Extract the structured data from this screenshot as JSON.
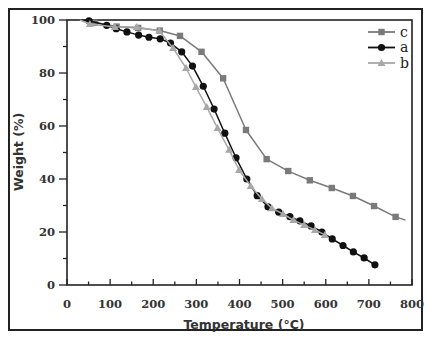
{
  "chart_data": {
    "type": "line",
    "title": "",
    "xlabel": "Temperature (°C)",
    "ylabel": "Weight (%)",
    "xlim": [
      0,
      800
    ],
    "ylim": [
      0,
      100
    ],
    "x_ticks": [
      0,
      100,
      200,
      300,
      400,
      500,
      600,
      700,
      800
    ],
    "y_ticks": [
      0,
      20,
      40,
      60,
      80,
      100
    ],
    "grid": false,
    "legend_position": "upper right",
    "legend": [
      "c",
      "a",
      "b"
    ],
    "series": [
      {
        "name": "c",
        "marker": "square",
        "color": "#7a7a7a",
        "x": [
          30,
          65,
          115,
          165,
          215,
          262,
          312,
          362,
          415,
          463,
          513,
          563,
          614,
          663,
          712,
          762,
          785
        ],
        "y": [
          100,
          99,
          97.5,
          97,
          96,
          94,
          88,
          78,
          58.5,
          47.5,
          43,
          39.5,
          36.6,
          33.6,
          29.8,
          25.7,
          24.5
        ],
        "markers_at": [
          65,
          115,
          165,
          215,
          262,
          312,
          362,
          415,
          463,
          513,
          563,
          614,
          663,
          712,
          762
        ]
      },
      {
        "name": "a",
        "marker": "circle",
        "color": "#111111",
        "x": [
          30,
          51,
          92,
          114,
          139,
          166,
          190,
          216,
          240,
          266,
          291,
          316,
          341,
          366,
          392,
          417,
          441,
          466,
          491,
          517,
          540,
          566,
          591,
          615,
          640,
          664,
          689,
          714
        ],
        "y": [
          100,
          99.7,
          98,
          96.7,
          95.5,
          94.3,
          93.5,
          92.9,
          91.3,
          88,
          82.6,
          75,
          66.4,
          57.3,
          48,
          40,
          33.7,
          29.5,
          27.5,
          25.8,
          24.2,
          22.3,
          20,
          17.4,
          14.9,
          12.5,
          10.2,
          7.6
        ],
        "markers_at": [
          51,
          92,
          114,
          139,
          166,
          190,
          216,
          240,
          266,
          291,
          316,
          341,
          366,
          392,
          417,
          441,
          466,
          491,
          517,
          540,
          566,
          591,
          615,
          640,
          664,
          689,
          714
        ]
      },
      {
        "name": "b",
        "marker": "triangle",
        "color": "#a8a8a8",
        "x": [
          30,
          53,
          111,
          162,
          214,
          246,
          276,
          299,
          324,
          349,
          376,
          399,
          426,
          452,
          475,
          501,
          525,
          550,
          575,
          598
        ],
        "y": [
          100,
          98.5,
          97.4,
          97.4,
          95.9,
          89.4,
          81.9,
          74.7,
          67.2,
          59.2,
          51,
          43.4,
          37.4,
          32.5,
          29,
          26.8,
          24.5,
          22.6,
          20.8,
          18.9
        ],
        "markers_at": [
          53,
          111,
          162,
          214,
          246,
          276,
          299,
          324,
          349,
          376,
          399,
          426,
          452,
          475,
          501,
          525,
          550,
          575,
          598
        ]
      }
    ]
  }
}
